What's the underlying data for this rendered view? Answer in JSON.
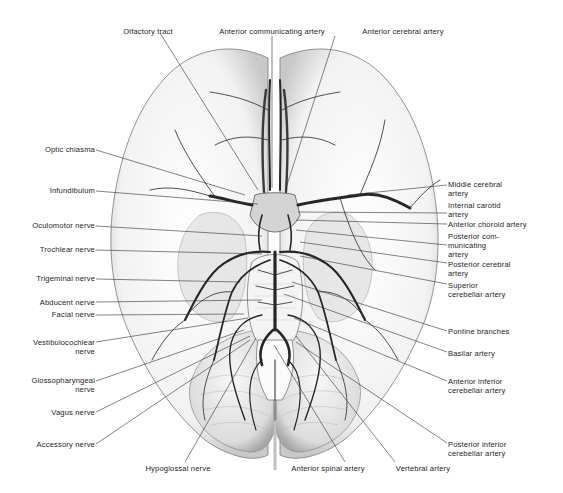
{
  "figure": {
    "colors": {
      "background": "#ffffff",
      "ink": "#1e1e1e",
      "vessel": "#2a2a2a",
      "tissue_shade": "#d8d8d8",
      "leader_line": "#333333"
    }
  },
  "labels": {
    "top": [
      {
        "id": "olfactory-tract",
        "text": "Olfactory tract",
        "x": 148,
        "y": 30,
        "tx": 258,
        "ty": 190
      },
      {
        "id": "anterior-communicating-artery",
        "text": "Anterior communicating artery",
        "x": 272,
        "y": 30,
        "tx": 272,
        "ty": 188
      },
      {
        "id": "anterior-cerebral-artery",
        "text": "Anterior cerebral artery",
        "x": 403,
        "y": 30,
        "tx": 286,
        "ty": 188
      }
    ],
    "left": [
      {
        "id": "optic-chiasma",
        "lines": [
          "Optic chiasma"
        ],
        "x": 95,
        "y": 147,
        "tx": 245,
        "ty": 195
      },
      {
        "id": "infundibulum",
        "lines": [
          "Infundibulum"
        ],
        "x": 95,
        "y": 188,
        "tx": 258,
        "ty": 204
      },
      {
        "id": "oculomotor-nerve",
        "lines": [
          "Oculomotor nerve"
        ],
        "x": 95,
        "y": 223,
        "tx": 262,
        "ty": 236
      },
      {
        "id": "trochlear-nerve",
        "lines": [
          "Trochlear nerve"
        ],
        "x": 95,
        "y": 247,
        "tx": 262,
        "ty": 254
      },
      {
        "id": "trigeminal-nerve",
        "lines": [
          "Trigeminal nerve"
        ],
        "x": 95,
        "y": 276,
        "tx": 240,
        "ty": 282
      },
      {
        "id": "abducent-nerve",
        "lines": [
          "Abducent nerve"
        ],
        "x": 95,
        "y": 300,
        "tx": 262,
        "ty": 300
      },
      {
        "id": "facial-nerve",
        "lines": [
          "Facial nerve"
        ],
        "x": 95,
        "y": 313,
        "tx": 244,
        "ty": 314
      },
      {
        "id": "vestibulocochlear-nerve",
        "lines": [
          "Vestibulocochlear",
          "nerve"
        ],
        "x": 95,
        "y": 340,
        "tx": 248,
        "ty": 318
      },
      {
        "id": "glossopharyngeal-nerve",
        "lines": [
          "Glossopharyngeal",
          "nerve"
        ],
        "x": 95,
        "y": 378,
        "tx": 244,
        "ty": 330
      },
      {
        "id": "vagus-nerve",
        "lines": [
          "Vagus nerve"
        ],
        "x": 95,
        "y": 410,
        "tx": 250,
        "ty": 336
      },
      {
        "id": "accessory-nerve",
        "lines": [
          "Accessory nerve"
        ],
        "x": 95,
        "y": 442,
        "tx": 250,
        "ty": 340
      }
    ],
    "right": [
      {
        "id": "middle-cerebral-artery",
        "lines": [
          "Middle cerebral",
          "artery"
        ],
        "x": 448,
        "y": 180,
        "tx": 348,
        "ty": 195
      },
      {
        "id": "internal-carotid-artery",
        "lines": [
          "Internal carotid",
          "artery"
        ],
        "x": 448,
        "y": 200,
        "tx": 298,
        "ty": 212
      },
      {
        "id": "anterior-choroid-artery",
        "lines": [
          "Anterior choroid artery"
        ],
        "x": 448,
        "y": 221,
        "tx": 296,
        "ty": 220
      },
      {
        "id": "posterior-communicating-artery",
        "lines": [
          "Posterior com-",
          "municating",
          "artery"
        ],
        "x": 448,
        "y": 234,
        "tx": 296,
        "ty": 230
      },
      {
        "id": "posterior-cerebral-artery",
        "lines": [
          "Posterior cerebral",
          "artery"
        ],
        "x": 448,
        "y": 260,
        "tx": 300,
        "ty": 242
      },
      {
        "id": "superior-cerebellar-artery",
        "lines": [
          "Superior",
          "cerebellar artery"
        ],
        "x": 448,
        "y": 281,
        "tx": 300,
        "ty": 256
      },
      {
        "id": "pontine-branches",
        "lines": [
          "Pontine branches"
        ],
        "x": 448,
        "y": 327,
        "tx": 292,
        "ty": 282
      },
      {
        "id": "basilar-artery",
        "lines": [
          "Basilar artery"
        ],
        "x": 448,
        "y": 349,
        "tx": 284,
        "ty": 294
      },
      {
        "id": "anterior-inferior-cerebellar-artery",
        "lines": [
          "Anterior inferior",
          "cerebellar artery"
        ],
        "x": 448,
        "y": 377,
        "tx": 294,
        "ty": 318
      },
      {
        "id": "posterior-inferior-cerebellar-artery",
        "lines": [
          "Posterior inferior",
          "cerebellar artery"
        ],
        "x": 448,
        "y": 440,
        "tx": 296,
        "ty": 342
      }
    ],
    "bottom": [
      {
        "id": "hypoglossal-nerve",
        "text": "Hypoglossal nerve",
        "x": 178,
        "y": 467,
        "tx": 256,
        "ty": 338
      },
      {
        "id": "anterior-spinal-artery",
        "text": "Anterior spinal artery",
        "x": 328,
        "y": 467,
        "tx": 274,
        "ty": 345
      },
      {
        "id": "vertebral-artery",
        "text": "Vertebral artery",
        "x": 395,
        "y": 467,
        "tx": 296,
        "ty": 336
      }
    ]
  }
}
